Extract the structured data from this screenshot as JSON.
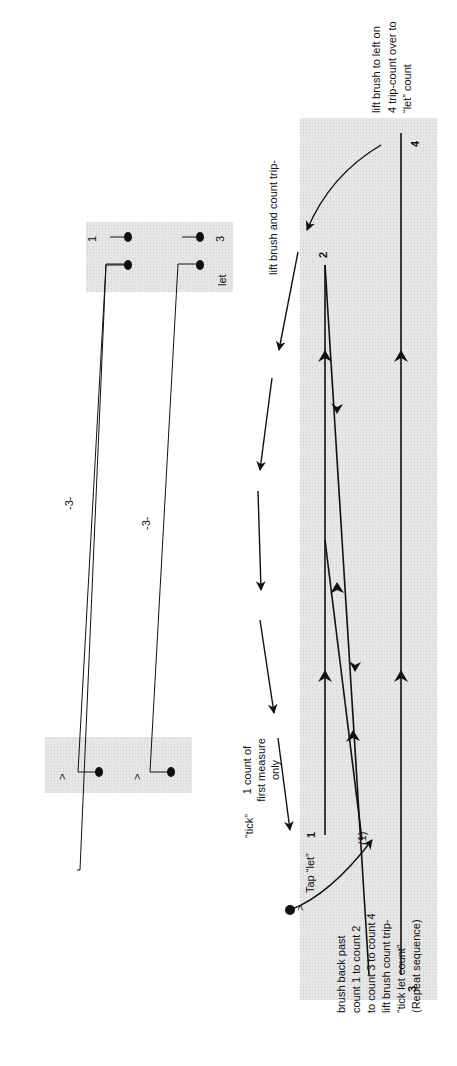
{
  "diagram": {
    "orientation": "rotated-90-ccw",
    "colors": {
      "shade": "#e3e3e3",
      "ink": "#111111"
    },
    "notation": {
      "triplet_label_1": "-3-",
      "triplet_label_2": "-3-",
      "accent_1": ">",
      "accent_2": ">",
      "count_1": "1",
      "count_3": "3",
      "count_let": "let"
    },
    "counts": {
      "c1": "1",
      "c2": "2",
      "c3": "3",
      "c4": "4",
      "c1_paren": "(1)"
    },
    "annotations": {
      "top_right": [
        "lift brush to left on",
        "4 trip-count over to",
        "“let” count"
      ],
      "lift_brush": "lift brush and count trip-",
      "tick": "“tick”",
      "first_measure": [
        "1 count of",
        "first measure",
        "only"
      ],
      "tap": "Tap “let”",
      "tap_accent": ">",
      "bottom": [
        "brush back past",
        "count 1 to count 2",
        "to count 3 to count 4",
        "lift brush count trip-",
        "“tick let count”",
        "(Repeat sequence)"
      ]
    }
  }
}
